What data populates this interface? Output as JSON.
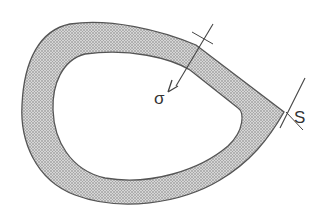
{
  "diagram": {
    "labels": {
      "sigma": "σ",
      "s": "S"
    },
    "colors": {
      "fill": "#c8c8c8",
      "stroke": "#555555",
      "background": "#ffffff"
    }
  }
}
